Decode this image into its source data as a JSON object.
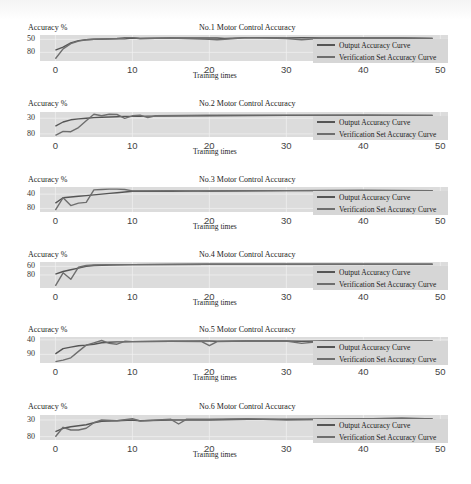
{
  "figure": {
    "ylabel": "Accuracy %",
    "xlabel": "Training times",
    "x_ticks": [
      "0",
      "10",
      "20",
      "30",
      "40",
      "50"
    ],
    "legend": [
      "Output Accuracy Curve",
      "Verification Set Accuracy Curve"
    ],
    "colors": {
      "plot_bg": "#dcdcdc",
      "line_output": "#555555",
      "line_verification": "#6e6e6e"
    }
  },
  "panels": [
    {
      "title": "No.1 Motor Control Accuracy",
      "y_ticks": [
        "80",
        "50"
      ]
    },
    {
      "title": "No.2 Motor Control Accuracy",
      "y_ticks": [
        "80",
        "30"
      ]
    },
    {
      "title": "No.3 Motor Control Accuracy",
      "y_ticks": [
        "80",
        "40"
      ]
    },
    {
      "title": "No.4 Motor Control Accuracy",
      "y_ticks": [
        "80",
        "60",
        ""
      ]
    },
    {
      "title": "No.5 Motor Control Accuracy",
      "y_ticks": [
        "90",
        "40"
      ]
    },
    {
      "title": "No.6 Motor Control Accuracy",
      "y_ticks": [
        "80",
        "30"
      ]
    }
  ],
  "chart_data": [
    {
      "type": "line",
      "title": "No.1 Motor Control Accuracy",
      "xlabel": "Training times",
      "ylabel": "Accuracy %",
      "xlim": [
        -2,
        51
      ],
      "ylim": [
        30,
        90
      ],
      "x_ticks": [
        0,
        10,
        20,
        30,
        40,
        50
      ],
      "y_ticks": [
        50,
        80
      ],
      "legend_position": "lower right",
      "grid": true,
      "x": [
        0,
        1,
        2,
        3,
        4,
        5,
        8,
        9,
        10,
        11,
        15,
        20,
        21,
        22,
        25,
        30,
        32,
        35,
        40,
        45,
        49
      ],
      "series": [
        {
          "name": "Output Accuracy Curve",
          "values": [
            55,
            62,
            72,
            77,
            79,
            80,
            81,
            81,
            83,
            82,
            83,
            83,
            83,
            82,
            84,
            83,
            84,
            83,
            83,
            83,
            82
          ]
        },
        {
          "name": "Verification Set Accuracy Curve",
          "values": [
            35,
            58,
            70,
            76,
            79,
            80,
            82,
            84,
            84,
            82,
            83,
            80,
            79,
            80,
            84,
            82,
            79,
            83,
            83,
            83,
            82
          ]
        }
      ]
    },
    {
      "type": "line",
      "title": "No.2 Motor Control Accuracy",
      "xlabel": "Training times",
      "ylabel": "Accuracy %",
      "xlim": [
        -2,
        51
      ],
      "ylim": [
        20,
        100
      ],
      "x_ticks": [
        0,
        10,
        20,
        30,
        40,
        50
      ],
      "y_ticks": [
        30,
        80
      ],
      "legend_position": "lower right",
      "grid": true,
      "x": [
        0,
        1,
        2,
        3,
        4,
        5,
        6,
        7,
        8,
        9,
        10,
        11,
        12,
        13,
        20,
        30,
        40,
        49
      ],
      "series": [
        {
          "name": "Output Accuracy Curve",
          "values": [
            55,
            68,
            75,
            78,
            80,
            82,
            83,
            84,
            85,
            86,
            86,
            86,
            87,
            87,
            88,
            89,
            90,
            89
          ]
        },
        {
          "name": "Verification Set Accuracy Curve",
          "values": [
            25,
            38,
            37,
            50,
            72,
            93,
            88,
            93,
            92,
            80,
            88,
            90,
            82,
            88,
            90,
            90,
            90,
            89
          ]
        }
      ]
    },
    {
      "type": "line",
      "title": "No.3 Motor Control Accuracy",
      "xlabel": "Training times",
      "ylabel": "Accuracy %",
      "xlim": [
        -2,
        51
      ],
      "ylim": [
        30,
        100
      ],
      "x_ticks": [
        0,
        10,
        20,
        30,
        40,
        50
      ],
      "y_ticks": [
        40,
        80
      ],
      "legend_position": "lower right",
      "grid": true,
      "x": [
        0,
        1,
        2,
        3,
        4,
        5,
        6,
        7,
        8,
        9,
        10,
        15,
        20,
        30,
        40,
        49
      ],
      "series": [
        {
          "name": "Output Accuracy Curve",
          "values": [
            55,
            70,
            72,
            74,
            76,
            78,
            80,
            82,
            84,
            86,
            88,
            88,
            89,
            90,
            90,
            90
          ]
        },
        {
          "name": "Verification Set Accuracy Curve",
          "values": [
            35,
            70,
            48,
            55,
            57,
            92,
            93,
            94,
            94,
            93,
            89,
            90,
            88,
            90,
            91,
            90
          ]
        }
      ]
    },
    {
      "type": "line",
      "title": "No.4 Motor Control Accuracy",
      "xlabel": "Training times",
      "ylabel": "Accuracy %",
      "xlim": [
        -2,
        51
      ],
      "ylim": [
        30,
        90
      ],
      "x_ticks": [
        0,
        10,
        20,
        30,
        40,
        50
      ],
      "y_ticks": [
        60,
        80
      ],
      "legend_position": "lower right",
      "grid": true,
      "x": [
        0,
        1,
        2,
        3,
        4,
        5,
        7,
        10,
        20,
        30,
        40,
        49
      ],
      "series": [
        {
          "name": "Output Accuracy Curve",
          "values": [
            62,
            68,
            72,
            76,
            80,
            82,
            83,
            84,
            85,
            85,
            85,
            85
          ]
        },
        {
          "name": "Verification Set Accuracy Curve",
          "values": [
            35,
            65,
            50,
            78,
            82,
            83,
            84,
            84,
            85,
            85,
            85,
            85
          ]
        }
      ]
    },
    {
      "type": "line",
      "title": "No.5 Motor Control Accuracy",
      "xlabel": "Training times",
      "ylabel": "Accuracy %",
      "xlim": [
        -2,
        51
      ],
      "ylim": [
        10,
        100
      ],
      "x_ticks": [
        0,
        10,
        20,
        30,
        40,
        50
      ],
      "y_ticks": [
        40,
        90
      ],
      "legend_position": "lower right",
      "grid": true,
      "x": [
        0,
        1,
        2,
        3,
        4,
        5,
        6,
        7,
        8,
        9,
        10,
        15,
        19,
        20,
        21,
        25,
        30,
        32,
        35,
        40,
        49
      ],
      "series": [
        {
          "name": "Output Accuracy Curve",
          "values": [
            42,
            60,
            65,
            70,
            72,
            75,
            80,
            82,
            83,
            83,
            84,
            85,
            86,
            86,
            85,
            86,
            86,
            85,
            86,
            87,
            86
          ]
        },
        {
          "name": "Verification Set Accuracy Curve",
          "values": [
            15,
            20,
            28,
            50,
            72,
            80,
            88,
            78,
            75,
            85,
            84,
            85,
            84,
            70,
            84,
            86,
            86,
            78,
            86,
            87,
            86
          ]
        }
      ]
    },
    {
      "type": "line",
      "title": "No.6 Motor Control Accuracy",
      "xlabel": "Training times",
      "ylabel": "Accuracy %",
      "xlim": [
        -2,
        51
      ],
      "ylim": [
        20,
        95
      ],
      "x_ticks": [
        0,
        10,
        20,
        30,
        40,
        50
      ],
      "y_ticks": [
        30,
        80
      ],
      "legend_position": "lower right",
      "grid": true,
      "x": [
        0,
        1,
        2,
        3,
        4,
        5,
        6,
        8,
        10,
        11,
        15,
        16,
        17,
        20,
        25,
        30,
        40,
        45,
        49
      ],
      "series": [
        {
          "name": "Output Accuracy Curve",
          "values": [
            45,
            55,
            60,
            63,
            66,
            72,
            76,
            78,
            80,
            78,
            80,
            80,
            80,
            80,
            82,
            82,
            83,
            83,
            83
          ]
        },
        {
          "name": "Verification Set Accuracy Curve",
          "values": [
            30,
            58,
            50,
            50,
            55,
            72,
            80,
            78,
            84,
            77,
            82,
            68,
            82,
            82,
            84,
            80,
            83,
            86,
            83
          ]
        }
      ]
    }
  ]
}
